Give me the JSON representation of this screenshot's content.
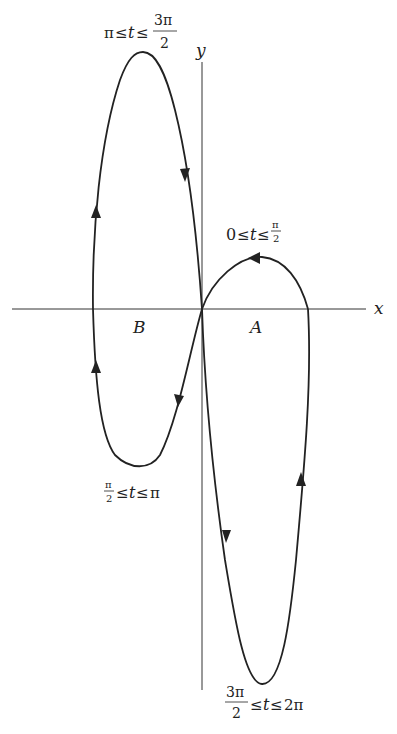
{
  "diagram": {
    "type": "parametric-curve",
    "axes": {
      "x_label": "x",
      "y_label": "y"
    },
    "regions": {
      "A": "A",
      "B": "B"
    },
    "segments": [
      {
        "id": "seg1",
        "range_left": "0",
        "le1": "≤",
        "t": "t",
        "le2": "≤",
        "range_right_num": "π",
        "range_right_den": "2"
      },
      {
        "id": "seg2",
        "range_left_num": "π",
        "range_left_den": "2",
        "le1": "≤",
        "t": "t",
        "le2": "≤",
        "range_right": "π"
      },
      {
        "id": "seg3",
        "range_left": "π",
        "le1": "≤",
        "t": "t",
        "le2": "≤",
        "range_right_num": "3π",
        "range_right_den": "2"
      },
      {
        "id": "seg4",
        "range_left_num": "3π",
        "range_left_den": "2",
        "le1": "≤",
        "t": "t",
        "le2": "≤",
        "range_right": "2π"
      }
    ],
    "colors": {
      "stroke": "#222222",
      "background": "#ffffff"
    }
  }
}
